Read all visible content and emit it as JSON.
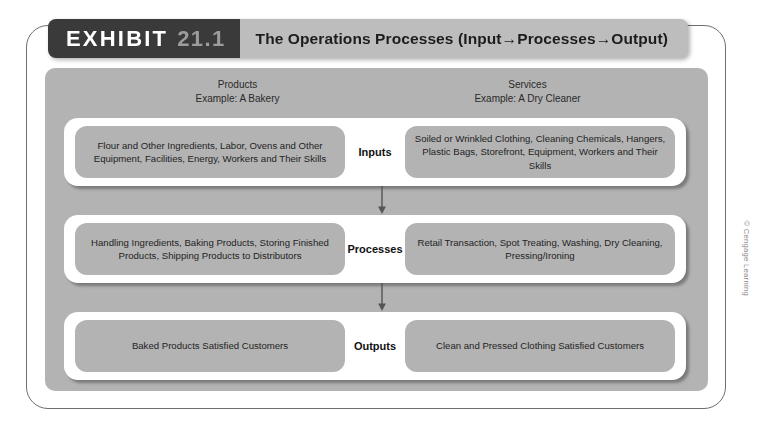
{
  "exhibit": {
    "label": "EXHIBIT",
    "number": "21.1",
    "title": "The Operations Processes (Input→Processes→Output)"
  },
  "columns": [
    {
      "name": "Products",
      "example": "Example: A Bakery"
    },
    {
      "name": "Services",
      "example": "Example: A Dry Cleaner"
    }
  ],
  "rows": [
    {
      "stage": "Inputs",
      "products": "Flour and Other Ingredients, Labor, Ovens and Other Equipment, Facilities, Energy, Workers and Their Skills",
      "services": "Soiled or Wrinkled Clothing, Cleaning Chemicals, Hangers, Plastic Bags, Storefront, Equipment, Workers and Their Skills"
    },
    {
      "stage": "Processes",
      "products": "Handling Ingredients, Baking Products, Storing Finished Products, Shipping Products to Distributors",
      "services": "Retail Transaction, Spot Treating, Washing, Dry Cleaning, Pressing/Ironing"
    },
    {
      "stage": "Outputs",
      "products": "Baked Products Satisfied Customers",
      "services": "Clean and Pressed Clothing Satisfied Customers"
    }
  ],
  "arrows": [
    {
      "name": "inputs-to-processes",
      "direction": "down"
    },
    {
      "name": "processes-to-outputs",
      "direction": "down"
    }
  ],
  "credit": "© Cengage Learning",
  "colors": {
    "badge_dark": "#3a3a3a",
    "title_plate": "#bdbdbd",
    "panel_gray": "#b3b3b3",
    "cell_gray": "#b3b3b3",
    "band_white": "#ffffff",
    "frame_border": "#6e6e6e",
    "text_dark": "#1f1f1f",
    "number_gray": "#9c9c9c",
    "credit_gray": "#8a8a8a"
  }
}
